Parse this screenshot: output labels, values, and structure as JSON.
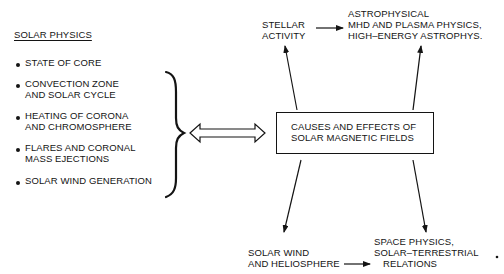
{
  "left_panel": {
    "heading": "SOLAR PHYSICS",
    "items": [
      {
        "line1": "STATE OF CORE",
        "line2": ""
      },
      {
        "line1": "CONVECTION ZONE",
        "line2": "AND SOLAR CYCLE"
      },
      {
        "line1": "HEATING OF CORONA",
        "line2": "AND CHROMOSPHERE"
      },
      {
        "line1": "FLARES AND CORONAL",
        "line2": "MASS EJECTIONS"
      },
      {
        "line1": "SOLAR WIND GENERATION",
        "line2": ""
      }
    ]
  },
  "center_box": {
    "line1": "CAUSES AND EFFECTS OF",
    "line2": "SOLAR MAGNETIC FIELDS"
  },
  "nodes": {
    "stellar_activity": {
      "line1": "STELLAR",
      "line2": "ACTIVITY"
    },
    "astrophysical": {
      "line1": "ASTROPHYSICAL",
      "line2": "MHD AND PLASMA PHYSICS,",
      "line3": "HIGH–ENERGY ASTROPHYS."
    },
    "solar_wind": {
      "line1": "SOLAR WIND",
      "line2": "AND HELIOSPHERE"
    },
    "space_physics": {
      "line1": "SPACE PHYSICS,",
      "line2": "SOLAR–TERRESTRIAL",
      "line3": "RELATIONS"
    }
  },
  "colors": {
    "ink": "#141414",
    "background": "#ffffff"
  }
}
